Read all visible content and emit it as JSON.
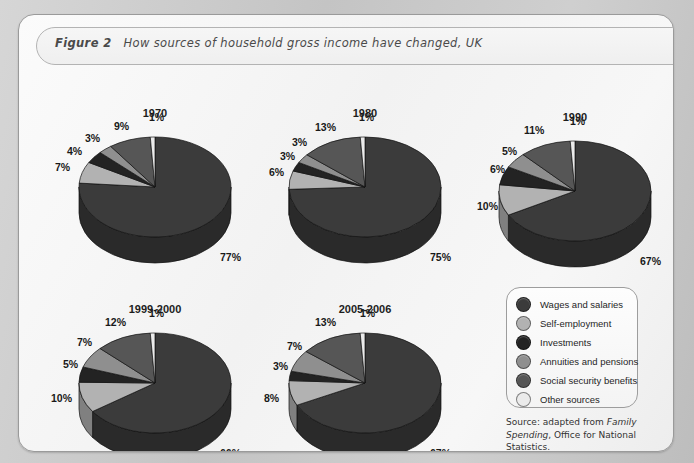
{
  "figure": {
    "label": "Figure 2",
    "title": "How sources of household gross income have changed, UK",
    "source_prefix": "Source: adapted from ",
    "source_italic": "Family Spending",
    "source_suffix": ", Office for National Statistics."
  },
  "legend": {
    "items": [
      {
        "label": "Wages and salaries",
        "color": "#3b3b3b"
      },
      {
        "label": "Self-employment",
        "color": "#b2b2b2"
      },
      {
        "label": "Investments",
        "color": "#232323"
      },
      {
        "label": "Annuities and pensions",
        "color": "#8f8f8f"
      },
      {
        "label": "Social security benefits",
        "color": "#565656"
      },
      {
        "label": "Other sources",
        "color": "#ebebeb"
      }
    ]
  },
  "chart_data": {
    "type": "pie",
    "title": "How sources of household gross income have changed, UK",
    "value_unit": "%",
    "categories": [
      "Wages and salaries",
      "Self-employment",
      "Investments",
      "Annuities and pensions",
      "Social security benefits",
      "Other sources"
    ],
    "colors": [
      "#3b3b3b",
      "#b2b2b2",
      "#232323",
      "#8f8f8f",
      "#565656",
      "#ebebeb"
    ],
    "charts": [
      {
        "title": "1970",
        "cx": 136,
        "cy": 172,
        "rx": 76,
        "ry": 50,
        "depth": 26,
        "slices": [
          {
            "category": "Wages and salaries",
            "value": 77,
            "label": "77%"
          },
          {
            "category": "Self-employment",
            "value": 7,
            "label": "7%"
          },
          {
            "category": "Investments",
            "value": 4,
            "label": "4%"
          },
          {
            "category": "Annuities and pensions",
            "value": 3,
            "label": "3%"
          },
          {
            "category": "Social security benefits",
            "value": 9,
            "label": "9%"
          },
          {
            "category": "Other sources",
            "value": 1,
            "label": "1%"
          }
        ],
        "labels": [
          {
            "text": "1%",
            "x": 130,
            "y": 96
          },
          {
            "text": "9%",
            "x": 95,
            "y": 105
          },
          {
            "text": "3%",
            "x": 66,
            "y": 117
          },
          {
            "text": "4%",
            "x": 48,
            "y": 130
          },
          {
            "text": "7%",
            "x": 36,
            "y": 146
          },
          {
            "text": "77%",
            "x": 201,
            "y": 236
          }
        ]
      },
      {
        "title": "1980",
        "cx": 346,
        "cy": 172,
        "rx": 76,
        "ry": 50,
        "depth": 26,
        "slices": [
          {
            "category": "Wages and salaries",
            "value": 75,
            "label": "75%"
          },
          {
            "category": "Self-employment",
            "value": 6,
            "label": "6%"
          },
          {
            "category": "Investments",
            "value": 3,
            "label": "3%"
          },
          {
            "category": "Annuities and pensions",
            "value": 3,
            "label": "3%"
          },
          {
            "category": "Social security benefits",
            "value": 13,
            "label": "13%"
          },
          {
            "category": "Other sources",
            "value": 1,
            "label": "1%"
          }
        ],
        "labels": [
          {
            "text": "1%",
            "x": 340,
            "y": 96
          },
          {
            "text": "13%",
            "x": 296,
            "y": 106
          },
          {
            "text": "3%",
            "x": 273,
            "y": 121
          },
          {
            "text": "3%",
            "x": 261,
            "y": 135
          },
          {
            "text": "6%",
            "x": 250,
            "y": 151
          },
          {
            "text": "75%",
            "x": 411,
            "y": 236
          }
        ]
      },
      {
        "title": "1990",
        "cx": 556,
        "cy": 176,
        "rx": 76,
        "ry": 50,
        "depth": 26,
        "slices": [
          {
            "category": "Wages and salaries",
            "value": 67,
            "label": "67%"
          },
          {
            "category": "Self-employment",
            "value": 10,
            "label": "10%"
          },
          {
            "category": "Investments",
            "value": 6,
            "label": "6%"
          },
          {
            "category": "Annuities and pensions",
            "value": 5,
            "label": "5%"
          },
          {
            "category": "Social security benefits",
            "value": 11,
            "label": "11%"
          },
          {
            "category": "Other sources",
            "value": 1,
            "label": "1%"
          }
        ],
        "labels": [
          {
            "text": "1%",
            "x": 551,
            "y": 100
          },
          {
            "text": "11%",
            "x": 505,
            "y": 109
          },
          {
            "text": "5%",
            "x": 483,
            "y": 130
          },
          {
            "text": "6%",
            "x": 471,
            "y": 148
          },
          {
            "text": "10%",
            "x": 458,
            "y": 185
          },
          {
            "text": "67%",
            "x": 621,
            "y": 240
          }
        ]
      },
      {
        "title": "1999-2000",
        "cx": 136,
        "cy": 368,
        "rx": 76,
        "ry": 50,
        "depth": 26,
        "slices": [
          {
            "category": "Wages and salaries",
            "value": 66,
            "label": "66%"
          },
          {
            "category": "Self-employment",
            "value": 10,
            "label": "10%"
          },
          {
            "category": "Investments",
            "value": 5,
            "label": "5%"
          },
          {
            "category": "Annuities and pensions",
            "value": 7,
            "label": "7%"
          },
          {
            "category": "Social security benefits",
            "value": 12,
            "label": "12%"
          },
          {
            "category": "Other sources",
            "value": 1,
            "label": "1%"
          }
        ],
        "labels": [
          {
            "text": "1%",
            "x": 130,
            "y": 292
          },
          {
            "text": "12%",
            "x": 86,
            "y": 301
          },
          {
            "text": "7%",
            "x": 58,
            "y": 321
          },
          {
            "text": "5%",
            "x": 44,
            "y": 343
          },
          {
            "text": "10%",
            "x": 32,
            "y": 377
          },
          {
            "text": "66%",
            "x": 201,
            "y": 432
          }
        ]
      },
      {
        "title": "2005-2006",
        "cx": 346,
        "cy": 368,
        "rx": 76,
        "ry": 50,
        "depth": 26,
        "slices": [
          {
            "category": "Wages and salaries",
            "value": 67,
            "label": "67%"
          },
          {
            "category": "Self-employment",
            "value": 8,
            "label": "8%"
          },
          {
            "category": "Investments",
            "value": 3,
            "label": "3%"
          },
          {
            "category": "Annuities and pensions",
            "value": 7,
            "label": "7%"
          },
          {
            "category": "Social security benefits",
            "value": 13,
            "label": "13%"
          },
          {
            "category": "Other sources",
            "value": 1,
            "label": "1%"
          }
        ],
        "labels": [
          {
            "text": "1%",
            "x": 341,
            "y": 292
          },
          {
            "text": "13%",
            "x": 296,
            "y": 301
          },
          {
            "text": "7%",
            "x": 268,
            "y": 325
          },
          {
            "text": "3%",
            "x": 254,
            "y": 345
          },
          {
            "text": "8%",
            "x": 245,
            "y": 377
          },
          {
            "text": "67%",
            "x": 411,
            "y": 432
          }
        ]
      }
    ]
  }
}
